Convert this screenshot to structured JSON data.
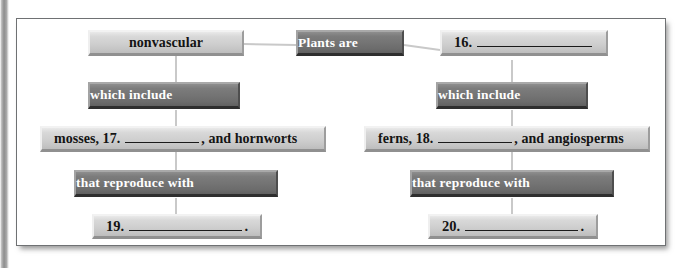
{
  "worksheet": {
    "type": "concept-map",
    "nodes": {
      "root": {
        "label": "Plants are",
        "style": "dark"
      },
      "branch_left": {
        "label": "nonvascular",
        "style": "light"
      },
      "branch_right": {
        "lead": "16.",
        "blank": true,
        "style": "light"
      },
      "link_left_1": {
        "label": "which include",
        "style": "dark"
      },
      "link_right_1": {
        "label": "which include",
        "style": "dark"
      },
      "list_left": {
        "lead": "mosses, 17.",
        "tail": ", and hornworts",
        "blank": true,
        "style": "light"
      },
      "list_right": {
        "lead": "ferns, 18.",
        "tail": ", and angiosperms",
        "blank": true,
        "style": "light"
      },
      "link_left_2": {
        "label": "that reproduce with",
        "style": "dark"
      },
      "link_right_2": {
        "label": "that reproduce with",
        "style": "dark"
      },
      "answer_left": {
        "lead": "19.",
        "tail": ".",
        "blank": true,
        "style": "light"
      },
      "answer_right": {
        "lead": "20.",
        "tail": ".",
        "blank": true,
        "style": "light"
      }
    },
    "colors": {
      "dark_box": "#737373",
      "light_box": "#cfcfcf",
      "dark_box_text": "#ffffff",
      "light_box_text": "#141414",
      "connector": "#c9c9c9",
      "frame_border": "#6f7173",
      "page_background": "#ffffff"
    }
  }
}
